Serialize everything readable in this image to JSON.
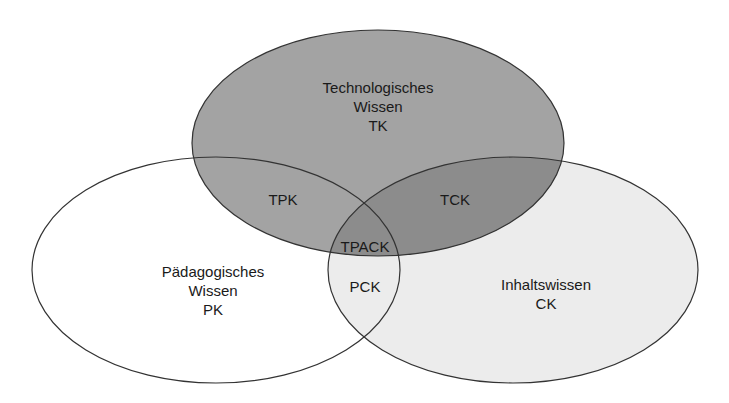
{
  "diagram": {
    "type": "venn",
    "sets": [
      {
        "id": "TK",
        "lines": [
          "Technologisches",
          "Wissen",
          "TK"
        ],
        "fill": "#a3a3a3"
      },
      {
        "id": "PK",
        "lines": [
          "Pädagogisches",
          "Wissen",
          "PK"
        ],
        "fill": "#ffffff"
      },
      {
        "id": "CK",
        "lines": [
          "Inhaltswissen",
          "CK"
        ],
        "fill": "#ececec"
      }
    ],
    "intersections": {
      "TPK": "TPK",
      "TCK": "TCK",
      "PCK": "PCK",
      "TPACK": "TPACK"
    },
    "colors": {
      "stroke": "#333333",
      "overlap_dark": "#8c8c8c"
    }
  }
}
